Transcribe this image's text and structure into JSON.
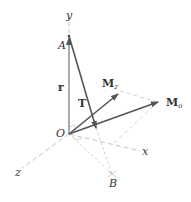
{
  "labels": {
    "y_axis": "y",
    "x_axis": "x",
    "z_axis": "z",
    "point_A": "A",
    "point_O": "O",
    "point_B": "B",
    "vector_r": "r",
    "vector_T": "T",
    "moment_z_main": "M",
    "moment_z_sub": "z",
    "moment_o_main": "M",
    "moment_o_sub": "o"
  },
  "colors": {
    "vector": "#555555",
    "dashed": "#b5b5b5",
    "text": "#333333"
  }
}
